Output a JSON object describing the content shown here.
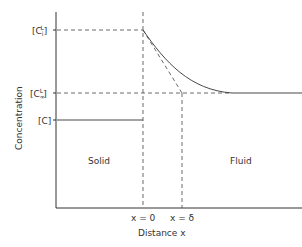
{
  "diagram": {
    "y_axis_label": "Concentration",
    "x_axis_label": "Distance x",
    "y_levels": [
      {
        "id": "ci",
        "base": "[C",
        "sub": "i",
        "sup": "L",
        "close": "]"
      },
      {
        "id": "cinf",
        "base": "[C",
        "sub": "∞",
        "sup": "L",
        "close": "]"
      },
      {
        "id": "c",
        "base": "[C]",
        "sub": "",
        "sup": "",
        "close": ""
      }
    ],
    "x_markers": [
      "x = 0",
      "x = δ"
    ],
    "regions": {
      "left": "Solid",
      "right": "Fluid"
    }
  }
}
